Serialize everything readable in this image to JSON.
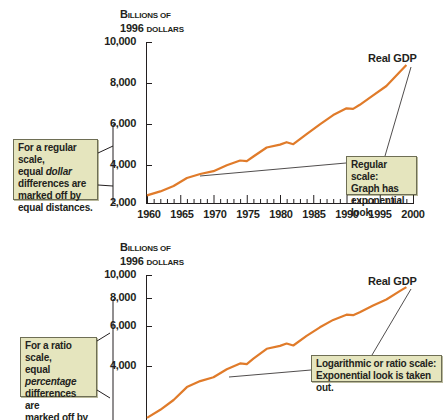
{
  "chart_data": [
    {
      "type": "line",
      "title": "",
      "ylabel": "Billions of 1996 dollars",
      "xlabel": "",
      "scale": "linear",
      "ylim": [
        2000,
        10000
      ],
      "yticks": [
        "10,000",
        "8,000",
        "6,000",
        "4,000",
        "2,000"
      ],
      "xticks": [
        "1960",
        "1965",
        "1970",
        "1975",
        "1980",
        "1985",
        "1990",
        "1995",
        "2000"
      ],
      "series": [
        {
          "name": "Real GDP",
          "color": "#e07b2a",
          "x": [
            1960,
            1962,
            1964,
            1966,
            1968,
            1970,
            1972,
            1974,
            1975,
            1976,
            1978,
            1980,
            1981,
            1982,
            1984,
            1986,
            1988,
            1990,
            1991,
            1992,
            1994,
            1996,
            1998,
            1999
          ],
          "values": [
            2377,
            2578,
            2846,
            3240,
            3440,
            3578,
            3880,
            4110,
            4084,
            4312,
            4760,
            4901,
            5021,
            4920,
            5420,
            5910,
            6370,
            6708,
            6676,
            6880,
            7348,
            7813,
            8508,
            8856
          ]
        }
      ],
      "annotations": [
        "For a regular scale, equal dollar differences are marked off by equal distances.",
        "Regular scale: Graph has exponential look."
      ]
    },
    {
      "type": "line",
      "title": "",
      "ylabel": "Billions of 1996 dollars",
      "xlabel": "",
      "scale": "log",
      "yticks": [
        "10,000",
        "8,000",
        "6,000",
        "4,000"
      ],
      "series": [
        {
          "name": "Real GDP",
          "color": "#e07b2a",
          "x": [
            1960,
            1962,
            1964,
            1966,
            1968,
            1970,
            1972,
            1974,
            1975,
            1976,
            1978,
            1980,
            1981,
            1982,
            1984,
            1986,
            1988,
            1990,
            1991,
            1992,
            1994,
            1996,
            1998,
            1999
          ],
          "values": [
            2377,
            2578,
            2846,
            3240,
            3440,
            3578,
            3880,
            4110,
            4084,
            4312,
            4760,
            4901,
            5021,
            4920,
            5420,
            5910,
            6370,
            6708,
            6676,
            6880,
            7348,
            7813,
            8508,
            8856
          ]
        }
      ],
      "annotations": [
        "For a ratio scale, equal percentage differences are marked off by equal distances.",
        "Logarithmic or ratio scale: Exponential look is taken out."
      ]
    }
  ],
  "top": {
    "ylabel_line1_a": "B",
    "ylabel_line1_b": "ILLIONS OF",
    "ylabel_line2_a": "1996 ",
    "ylabel_line2_b": "DOLLARS",
    "yticks": [
      "10,000",
      "8,000",
      "6,000",
      "4,000",
      "2,000"
    ],
    "xticks": [
      "1960",
      "1965",
      "1970",
      "1975",
      "1980",
      "1985",
      "1990",
      "1995",
      "2000"
    ],
    "series_label": "Real GDP",
    "left_note": {
      "l1": "For a regular scale,",
      "l2a": "equal ",
      "l2b": "dollar",
      "l3": "differences are",
      "l4": "marked off by",
      "l5": "equal distances."
    },
    "right_note": {
      "l1": "Regular scale:",
      "l2": "Graph has",
      "l3": "exponential look."
    }
  },
  "bottom": {
    "ylabel_line1_a": "B",
    "ylabel_line1_b": "ILLIONS OF",
    "ylabel_line2_a": "1996 ",
    "ylabel_line2_b": "DOLLARS",
    "yticks": [
      "10,000",
      "8,000",
      "6,000",
      "4,000"
    ],
    "series_label": "Real GDP",
    "left_note": {
      "l1": "For a ratio scale,",
      "l2a": "equal ",
      "l2b": "percentage",
      "l3": "differences are",
      "l4": "marked off by",
      "l5": "equal distances."
    },
    "right_note": {
      "l1": "Logarithmic or ratio scale:",
      "l2": "Exponential look is taken out."
    }
  },
  "colors": {
    "line": "#e07b2a",
    "box_fill": "#e5e5be",
    "box_border": "#6e6e55",
    "axis": "#231f20"
  }
}
